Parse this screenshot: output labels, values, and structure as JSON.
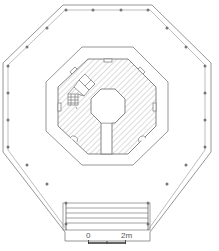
{
  "drawing": {
    "type": "octagonal pavilion floor plan",
    "colors": {
      "line": "#8a8a8a",
      "dark_line": "#666666",
      "post": "#777777",
      "hatch": "#9a9a9a",
      "background": "#ffffff"
    },
    "elements": [
      "outer-octagonal-deck-with-railing-posts",
      "middle-octagonal-wall",
      "inner-hatched-octagonal-core",
      "central-octagonal-void",
      "corridor-from-void-to-south",
      "spiral-stair-northwest",
      "entrance-steps-south"
    ],
    "railing_post_count": 30,
    "entrance_step_lines": 4
  },
  "scale_bar": {
    "start_label": "0",
    "end_label": "2m"
  }
}
